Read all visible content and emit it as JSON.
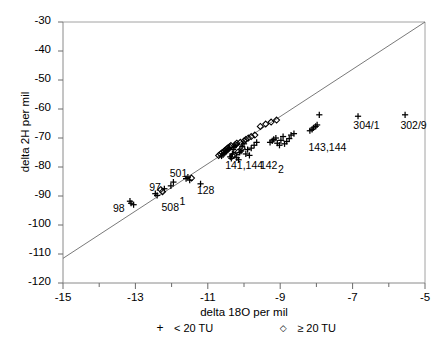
{
  "chart_data": {
    "type": "scatter",
    "title": "",
    "xlabel": "delta 18O  per mil",
    "ylabel": "delta 2H  per mil",
    "xlim": [
      -15,
      -5
    ],
    "ylim": [
      -120,
      -30
    ],
    "xticks": [
      -15,
      -13,
      -11,
      -9,
      -7,
      -5
    ],
    "xticklabels": [
      "-15",
      "-13",
      "-11",
      "-9",
      "-7",
      "-5"
    ],
    "xminorticks": [
      -14,
      -12,
      -10,
      -8,
      -6
    ],
    "yticks": [
      -30,
      -40,
      -50,
      -60,
      -70,
      -80,
      -90,
      -100,
      -110,
      -120
    ],
    "yticklabels": [
      "-30",
      "-40",
      "-50",
      "-60",
      "-70",
      "-80",
      "-90",
      "-100",
      "-110",
      "-120"
    ],
    "grid": false,
    "legend_position": "below-axis",
    "reference_line": {
      "name": "global-meteoric-water-line",
      "slope": 8,
      "intercept": 10,
      "x_start": -15.1,
      "y_start": -111.5,
      "x_end": -5.0,
      "y_end": -30.0
    },
    "series": [
      {
        "name": "< 20 TU",
        "marker": "plus",
        "x": [
          -13.15,
          -13.12,
          -13.05,
          -12.45,
          -12.4,
          -12.2,
          -12.02,
          -11.95,
          -11.6,
          -11.55,
          -11.5,
          -11.2,
          -10.62,
          -10.58,
          -10.55,
          -10.5,
          -10.48,
          -10.45,
          -10.42,
          -10.4,
          -10.38,
          -10.35,
          -10.32,
          -10.3,
          -10.28,
          -10.25,
          -10.22,
          -10.2,
          -10.15,
          -10.12,
          -10.08,
          -10.05,
          -10.0,
          -9.95,
          -9.9,
          -9.85,
          -9.8,
          -9.72,
          -9.65,
          -9.28,
          -9.22,
          -9.18,
          -9.12,
          -9.08,
          -9.02,
          -8.98,
          -8.92,
          -8.88,
          -8.82,
          -8.75,
          -8.7,
          -8.62,
          -8.18,
          -8.12,
          -8.08,
          -8.02,
          -7.98,
          -7.92,
          -6.85,
          -5.55
        ],
        "y": [
          -91.8,
          -92.5,
          -93.0,
          -89.2,
          -89.8,
          -87.5,
          -86.5,
          -85.2,
          -84.0,
          -83.5,
          -84.5,
          -85.8,
          -76.2,
          -75.8,
          -75.2,
          -74.8,
          -74.5,
          -74.2,
          -73.8,
          -73.5,
          -76.5,
          -77.0,
          -75.5,
          -74.0,
          -73.2,
          -72.8,
          -72.5,
          -76.8,
          -77.5,
          -75.0,
          -74.5,
          -73.0,
          -72.0,
          -75.5,
          -74.0,
          -76.0,
          -73.5,
          -72.5,
          -71.5,
          -71.5,
          -71.0,
          -70.5,
          -70.0,
          -71.8,
          -72.5,
          -70.8,
          -69.5,
          -72.0,
          -71.2,
          -70.2,
          -69.0,
          -68.5,
          -67.5,
          -67.0,
          -66.5,
          -66.0,
          -65.5,
          -62.0,
          -62.5,
          -62.0
        ]
      },
      {
        "name": "≥ 20 TU",
        "marker": "diamond",
        "x": [
          -12.3,
          -12.25,
          -11.45,
          -10.7,
          -10.65,
          -10.6,
          -10.55,
          -10.52,
          -10.48,
          -10.44,
          -10.4,
          -10.36,
          -10.32,
          -10.28,
          -10.24,
          -10.2,
          -10.16,
          -10.1,
          -10.05,
          -10.0,
          -9.95,
          -9.88,
          -9.8,
          -9.7,
          -9.55,
          -9.4,
          -9.25,
          -9.1
        ],
        "y": [
          -87.8,
          -88.5,
          -83.8,
          -76.0,
          -75.5,
          -75.0,
          -74.6,
          -74.2,
          -73.8,
          -73.4,
          -73.0,
          -72.6,
          -76.2,
          -75.8,
          -72.2,
          -71.8,
          -74.8,
          -71.5,
          -73.5,
          -71.0,
          -70.5,
          -70.0,
          -69.5,
          -69.0,
          -66.0,
          -65.2,
          -64.5,
          -63.8
        ]
      }
    ],
    "annotations": [
      {
        "text": "98",
        "x": -13.62,
        "y": -94.6
      },
      {
        "text": "97",
        "x": -12.62,
        "y": -87.3
      },
      {
        "text": "508",
        "x": -12.28,
        "y": -94.3
      },
      {
        "text": "1",
        "x": -11.78,
        "y": -92.0
      },
      {
        "text": "501",
        "x": -12.05,
        "y": -82.4
      },
      {
        "text": "128",
        "x": -11.3,
        "y": -88.4
      },
      {
        "text": "141,144",
        "x": -10.52,
        "y": -79.8
      },
      {
        "text": "142",
        "x": -9.56,
        "y": -79.8
      },
      {
        "text": "2",
        "x": -9.06,
        "y": -81.2
      },
      {
        "text": "143,144",
        "x": -8.22,
        "y": -73.5
      },
      {
        "text": "304/1",
        "x": -6.98,
        "y": -66.0
      },
      {
        "text": "302/9",
        "x": -5.68,
        "y": -66.0
      }
    ]
  },
  "legend": {
    "items": [
      {
        "glyph": "+",
        "label": "< 20 TU"
      },
      {
        "glyph": "◇",
        "label": "≥ 20 TU"
      }
    ]
  }
}
